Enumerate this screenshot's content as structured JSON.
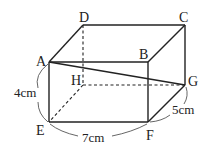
{
  "figure": {
    "type": "rectangular-prism",
    "vertices": {
      "A": {
        "label": "A",
        "x": 49,
        "y": 62
      },
      "B": {
        "label": "B",
        "x": 148,
        "y": 62
      },
      "C": {
        "label": "C",
        "x": 185,
        "y": 25
      },
      "D": {
        "label": "D",
        "x": 83,
        "y": 25
      },
      "E": {
        "label": "E",
        "x": 49,
        "y": 122
      },
      "F": {
        "label": "F",
        "x": 148,
        "y": 122
      },
      "G": {
        "label": "G",
        "x": 185,
        "y": 85
      },
      "H": {
        "label": "H",
        "x": 83,
        "y": 85
      }
    },
    "hidden_edges": [
      "DH",
      "HE",
      "HG"
    ],
    "diagonal": "AG",
    "dimensions": {
      "AE": "4cm",
      "EF": "7cm",
      "FG": "5cm"
    }
  }
}
